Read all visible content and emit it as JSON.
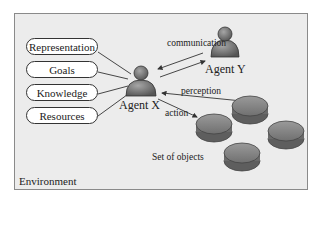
{
  "diagram": {
    "title": "",
    "environment_label": "Environment",
    "attributes": [
      "Representation",
      "Goals",
      "Knowledge",
      "Resources"
    ],
    "agents": [
      {
        "id": "agent-x",
        "label": "Agent X"
      },
      {
        "id": "agent-y",
        "label": "Agent Y"
      }
    ],
    "edges": [
      {
        "from": "agent-x",
        "to": "agent-y",
        "label": "communication",
        "bidirectional": true
      },
      {
        "from": "objects",
        "to": "agent-x",
        "label": "perception"
      },
      {
        "from": "agent-x",
        "to": "objects",
        "label": "action"
      }
    ],
    "objects": {
      "label": "Set of objects",
      "count": 4
    },
    "colors": {
      "background": "#ececec",
      "frame_border": "#8a8a8a",
      "agent_fill": "#6e6e6e",
      "object_fill": "#7d7d7d",
      "line": "#333333"
    }
  }
}
